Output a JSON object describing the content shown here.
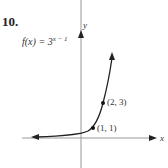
{
  "problem": {
    "number": "10.",
    "function_base": "f(x) = 3",
    "function_exponent": "x − 1"
  },
  "axes": {
    "x_label": "x",
    "y_label": "y"
  },
  "points": [
    {
      "label": "(1, 1)",
      "x": 1,
      "y": 1
    },
    {
      "label": "(2, 3)",
      "x": 2,
      "y": 3
    }
  ],
  "colors": {
    "axis": "#999999",
    "curve": "#222222"
  }
}
